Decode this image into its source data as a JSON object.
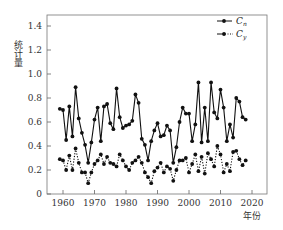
{
  "chart_data": {
    "type": "line",
    "title": "",
    "xlabel": "年份",
    "ylabel": "统计量",
    "xlim": [
      1955,
      2025
    ],
    "ylim": [
      0,
      1.5
    ],
    "x_ticks": [
      1960,
      1970,
      1980,
      1990,
      2000,
      2010,
      2020
    ],
    "y_ticks": [
      0,
      0.2,
      0.4,
      0.6,
      0.8,
      1.0,
      1.2,
      1.4
    ],
    "y_tick_labels": [
      "0",
      "0.2",
      "0.4",
      "0.6",
      "0.8",
      "1.0",
      "1.2",
      "1.4"
    ],
    "grid": false,
    "legend_position": "upper right",
    "x": [
      1959,
      1960,
      1961,
      1962,
      1963,
      1964,
      1965,
      1966,
      1967,
      1968,
      1969,
      1970,
      1971,
      1972,
      1973,
      1974,
      1975,
      1976,
      1977,
      1978,
      1979,
      1980,
      1981,
      1982,
      1983,
      1984,
      1985,
      1986,
      1987,
      1988,
      1989,
      1990,
      1991,
      1992,
      1993,
      1994,
      1995,
      1996,
      1997,
      1998,
      1999,
      2000,
      2001,
      2002,
      2003,
      2004,
      2005,
      2006,
      2007,
      2008,
      2009,
      2010,
      2011,
      2012,
      2013,
      2014,
      2015,
      2016,
      2017,
      2018
    ],
    "series": [
      {
        "name": "Cn",
        "label_main": "C",
        "label_sub": "n",
        "line_style": "solid",
        "marker": "circle",
        "values": [
          0.71,
          0.7,
          0.45,
          0.73,
          0.48,
          0.89,
          0.63,
          0.51,
          0.41,
          0.26,
          0.43,
          0.62,
          0.72,
          0.44,
          0.73,
          0.75,
          0.59,
          0.54,
          0.88,
          0.64,
          0.55,
          0.57,
          0.58,
          0.61,
          0.83,
          0.76,
          0.46,
          0.41,
          0.28,
          0.44,
          0.53,
          0.59,
          0.48,
          0.49,
          0.57,
          0.53,
          0.26,
          0.39,
          0.6,
          0.72,
          0.67,
          0.67,
          0.44,
          0.58,
          0.93,
          0.43,
          0.72,
          0.44,
          0.93,
          0.68,
          0.63,
          0.87,
          0.72,
          0.44,
          0.58,
          0.47,
          0.8,
          0.77,
          0.64,
          0.62
        ]
      },
      {
        "name": "Cy",
        "label_main": "C",
        "label_sub": "y",
        "line_style": "dotted",
        "marker": "circle",
        "values": [
          0.29,
          0.28,
          0.2,
          0.32,
          0.2,
          0.38,
          0.26,
          0.18,
          0.18,
          0.09,
          0.18,
          0.25,
          0.28,
          0.33,
          0.25,
          0.31,
          0.26,
          0.25,
          0.23,
          0.33,
          0.28,
          0.23,
          0.2,
          0.26,
          0.28,
          0.31,
          0.26,
          0.18,
          0.14,
          0.09,
          0.19,
          0.22,
          0.26,
          0.18,
          0.23,
          0.21,
          0.11,
          0.2,
          0.28,
          0.28,
          0.3,
          0.18,
          0.25,
          0.33,
          0.19,
          0.31,
          0.17,
          0.34,
          0.29,
          0.23,
          0.4,
          0.33,
          0.18,
          0.25,
          0.19,
          0.35,
          0.36,
          0.29,
          0.24,
          0.28
        ]
      }
    ]
  },
  "colors": {
    "line": "#111111",
    "axis": "#555555",
    "text": "#333333"
  }
}
